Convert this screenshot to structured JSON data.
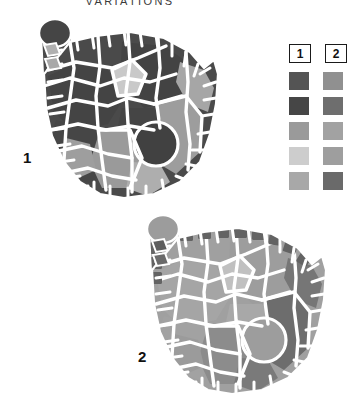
{
  "title": "VARIATIONS",
  "figures": [
    {
      "id": "figure-1",
      "label": "1"
    },
    {
      "id": "figure-2",
      "label": "2"
    }
  ],
  "legend": {
    "columns": [
      {
        "header": "1"
      },
      {
        "header": "2"
      }
    ],
    "rows": [
      {
        "col1": "#545454",
        "col2": "#909090"
      },
      {
        "col1": "#464646",
        "col2": "#6e6e6e"
      },
      {
        "col1": "#9a9a9a",
        "col2": "#a2a2a2"
      },
      {
        "col1": "#cdcdcd",
        "col2": "#9e9e9e"
      },
      {
        "col1": "#a8a8a8",
        "col2": "#6a6a6a"
      }
    ]
  },
  "palette": {
    "fig1": {
      "dark": "#4a4a4a",
      "darker": "#414141",
      "mid": "#9b9b9b",
      "light": "#cdcdcd",
      "midlight": "#ababab",
      "outline": "#ffffff"
    },
    "fig2": {
      "dark": "#8f8f8f",
      "darker": "#6f6f6f",
      "mid": "#a3a3a3",
      "light": "#bdbdbd",
      "midlight": "#6a6a6a",
      "outline": "#ffffff"
    }
  }
}
